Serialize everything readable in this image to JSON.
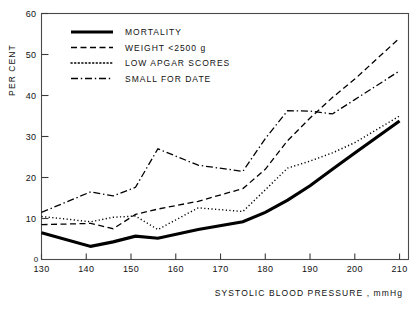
{
  "chart_data": {
    "type": "line",
    "title": "",
    "xlabel": "SYSTOLIC BLOOD PRESSURE , mmHg",
    "ylabel": "PER CENT",
    "xlim": [
      130,
      212
    ],
    "ylim": [
      0,
      60
    ],
    "grid": false,
    "legend_position": "top-left",
    "xticks": [
      130,
      140,
      150,
      160,
      170,
      180,
      190,
      200,
      210
    ],
    "xtick_labels": [
      "130",
      "140",
      "150",
      "160",
      "170",
      "180",
      "190",
      "200",
      "210"
    ],
    "yticks": [
      0,
      10,
      20,
      30,
      40,
      50,
      60
    ],
    "ytick_labels": [
      "0",
      "10",
      "20",
      "30",
      "40",
      "50",
      "60"
    ],
    "x": [
      130,
      141,
      146,
      151,
      156,
      165,
      175,
      180,
      185,
      190,
      195,
      200,
      210
    ],
    "series": [
      {
        "name": "MORTALITY",
        "style": "solid",
        "stroke_width": 3.1,
        "values": [
          6.5,
          3.2,
          4.3,
          5.7,
          5.2,
          7.3,
          9.2,
          11.5,
          14.5,
          18.0,
          22.0,
          26.0,
          33.8
        ]
      },
      {
        "name": "WEIGHT <2500 g",
        "style": "dashed",
        "stroke_width": 1.3,
        "values": [
          8.5,
          8.8,
          7.5,
          11.0,
          12.3,
          14.2,
          17.3,
          22.0,
          29.0,
          34.5,
          39.5,
          44.0,
          54.0
        ]
      },
      {
        "name": "LOW APGAR SCORES",
        "style": "dotted",
        "stroke_width": 1.4,
        "values": [
          10.5,
          9.2,
          10.3,
          10.6,
          7.3,
          12.6,
          11.7,
          17.0,
          22.3,
          24.0,
          26.0,
          28.5,
          35.0
        ]
      },
      {
        "name": "SMALL FOR DATE",
        "style": "dashdot",
        "stroke_width": 1.3,
        "values": [
          11.5,
          16.5,
          15.5,
          17.6,
          27.0,
          23.0,
          21.5,
          29.5,
          36.3,
          36.2,
          35.5,
          39.0,
          46.0
        ]
      }
    ]
  },
  "legend": {
    "entries": [
      {
        "label": "MORTALITY",
        "style": "solid"
      },
      {
        "label": "WEIGHT <2500 g",
        "style": "dashed"
      },
      {
        "label": "LOW APGAR SCORES",
        "style": "dotted"
      },
      {
        "label": "SMALL FOR DATE",
        "style": "dashdot"
      }
    ]
  },
  "axes": {
    "y_axis_title": "PER CENT",
    "x_axis_title": "SYSTOLIC BLOOD PRESSURE , mmHg",
    "origin_label": "0"
  },
  "colors": {
    "line": "#000000",
    "frame": "#4a4a4a",
    "background": "#ffffff"
  }
}
